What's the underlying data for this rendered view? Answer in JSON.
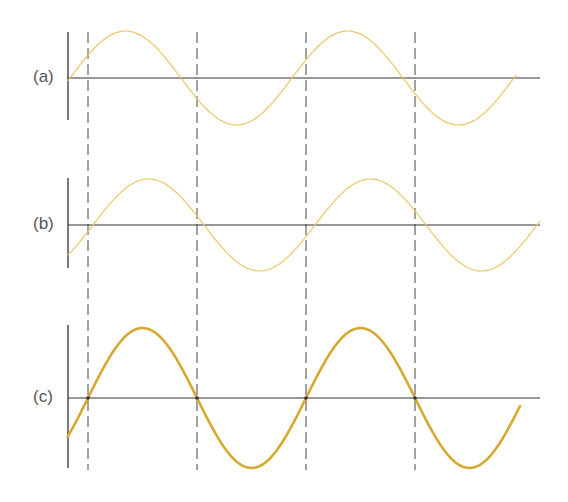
{
  "panels": [
    {
      "id": "a",
      "label": "(a)",
      "axis_y": 78,
      "bar_top": 32,
      "bar_bottom": 120,
      "axis_end": 540,
      "curve_start": 68,
      "curve_end": 516,
      "amplitude": 47,
      "zero_x": 70,
      "period": 222,
      "stroke": "#ecc766",
      "stroke_width": 1.2
    },
    {
      "id": "b",
      "label": "(b)",
      "axis_y": 225,
      "bar_top": 178,
      "bar_bottom": 268,
      "axis_end": 540,
      "curve_start": 68,
      "curve_end": 540,
      "amplitude": 46,
      "zero_x": 93,
      "period": 222,
      "stroke": "#ecc766",
      "stroke_width": 1.2
    },
    {
      "id": "c",
      "label": "(c)",
      "axis_y": 398,
      "bar_top": 325,
      "bar_bottom": 468,
      "axis_end": 540,
      "curve_start": 68,
      "curve_end": 520,
      "amplitude": 70,
      "zero_x": 88,
      "period": 218,
      "stroke": "#d8a82e",
      "stroke_width": 2.6
    }
  ],
  "dashed_lines": {
    "x": [
      88,
      197,
      306,
      415
    ],
    "top": 32,
    "bottom": 470,
    "color": "#444444"
  },
  "colors": {
    "axis": "#333333",
    "label": "#555555",
    "background": "#ffffff"
  }
}
